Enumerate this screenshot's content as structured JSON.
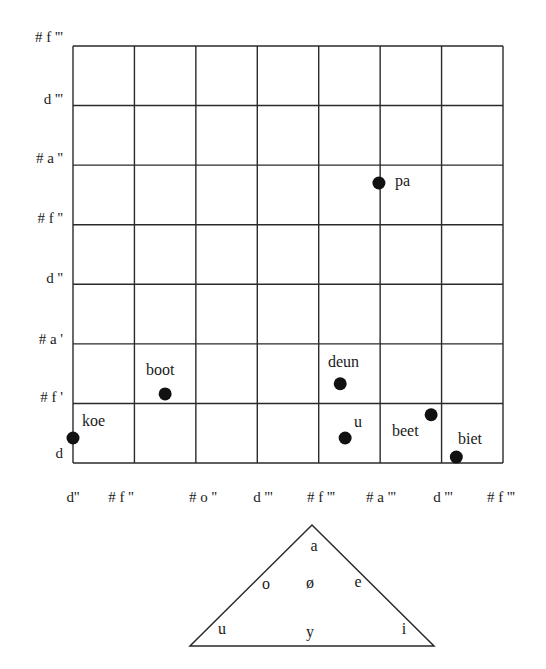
{
  "chart_data": {
    "type": "scatter",
    "title": "",
    "xlabel": "",
    "ylabel": "",
    "grid": true,
    "legend": null,
    "x_tick_labels": [
      "d''",
      "# f ''",
      "# o ''",
      "d '''",
      "# f '''",
      "# a '''",
      "d '''",
      "# f '''"
    ],
    "y_tick_labels": [
      "d",
      "# f '",
      "# a '",
      "d ''",
      "# f ''",
      "# a ''",
      "d '''",
      "# f '''"
    ],
    "xlim": [
      0,
      7
    ],
    "ylim": [
      0,
      7
    ],
    "points": [
      {
        "label": "koe",
        "x": 0.0,
        "y": 0.42
      },
      {
        "label": "boot",
        "x": 1.5,
        "y": 1.16
      },
      {
        "label": "deun",
        "x": 4.35,
        "y": 1.33
      },
      {
        "label": "u",
        "x": 4.43,
        "y": 0.42
      },
      {
        "label": "beet",
        "x": 5.83,
        "y": 0.81
      },
      {
        "label": "biet",
        "x": 6.24,
        "y": 0.1
      },
      {
        "label": "pa",
        "x": 4.98,
        "y": 4.7
      }
    ]
  },
  "vowel_triangle": {
    "labels": [
      {
        "id": "a",
        "text": "a"
      },
      {
        "id": "o",
        "text": "o"
      },
      {
        "id": "oe",
        "text": "ø"
      },
      {
        "id": "e",
        "text": "e"
      },
      {
        "id": "u",
        "text": "u"
      },
      {
        "id": "y",
        "text": "y"
      },
      {
        "id": "i",
        "text": "i"
      }
    ]
  },
  "colors": {
    "grid": "#2a2a2a",
    "point": "#111111",
    "text": "#1a1a1a"
  }
}
